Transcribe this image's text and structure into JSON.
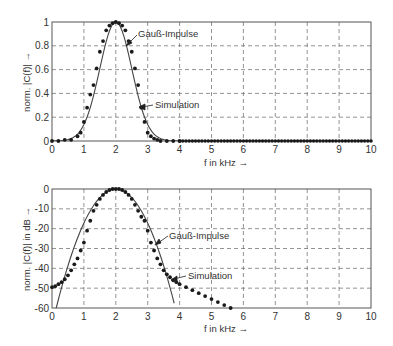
{
  "chart_data": [
    {
      "type": "line",
      "title": "",
      "xlabel": "f  in kHz →",
      "ylabel": "norm. |C(f)| →",
      "xlim": [
        0,
        10
      ],
      "ylim": [
        0,
        1
      ],
      "xticks": [
        "0",
        "1",
        "2",
        "3",
        "4",
        "5",
        "6",
        "7",
        "8",
        "9",
        "10"
      ],
      "yticks": [
        "0",
        "0.2",
        "0.4",
        "0.6",
        "0.8",
        "1"
      ],
      "grid": true,
      "annotations": [
        "Gauß-Impulse",
        "Simulation"
      ],
      "series": [
        {
          "name": "Gauß-Impulse",
          "style": "solid line",
          "x": [
            0,
            0.5,
            0.8,
            1.0,
            1.2,
            1.4,
            1.6,
            1.8,
            2.0,
            2.2,
            2.4,
            2.6,
            2.8,
            3.0,
            3.2,
            3.5,
            4.0,
            10
          ],
          "y": [
            0.0,
            0.01,
            0.06,
            0.14,
            0.28,
            0.49,
            0.73,
            0.92,
            1.0,
            0.92,
            0.73,
            0.49,
            0.28,
            0.14,
            0.06,
            0.01,
            0.0,
            0.0
          ]
        },
        {
          "name": "Simulation",
          "style": "dots",
          "x": [
            0,
            0.2,
            0.4,
            0.6,
            0.8,
            0.9,
            1.0,
            1.1,
            1.2,
            1.3,
            1.4,
            1.5,
            1.6,
            1.7,
            1.8,
            1.9,
            2.0,
            2.1,
            2.2,
            2.3,
            2.4,
            2.5,
            2.6,
            2.7,
            2.8,
            2.9,
            3.0,
            3.1,
            3.2,
            3.3,
            3.4,
            3.6,
            3.8,
            4.0,
            10
          ],
          "y": [
            0.0,
            0.0,
            0.01,
            0.01,
            0.04,
            0.07,
            0.16,
            0.28,
            0.39,
            0.47,
            0.61,
            0.75,
            0.84,
            0.93,
            0.97,
            0.99,
            1.0,
            0.99,
            0.97,
            0.93,
            0.84,
            0.75,
            0.61,
            0.47,
            0.28,
            0.16,
            0.07,
            0.04,
            0.02,
            0.01,
            0.0,
            0.0,
            0.0,
            0.0,
            0.0
          ]
        }
      ]
    },
    {
      "type": "line",
      "title": "",
      "xlabel": "f  in kHz →",
      "ylabel": "norm. |C(f)|  in dB →",
      "xlim": [
        0,
        10
      ],
      "ylim": [
        -60,
        0
      ],
      "xticks": [
        "0",
        "1",
        "2",
        "3",
        "4",
        "5",
        "6",
        "7",
        "8",
        "9",
        "10"
      ],
      "yticks": [
        "0",
        "-10",
        "-20",
        "-30",
        "-40",
        "-50",
        "-60"
      ],
      "grid": true,
      "annotations": [
        "Gauß-Impulse",
        "Simulation"
      ],
      "series": [
        {
          "name": "Gauß-Impulse",
          "style": "solid line",
          "x": [
            0.13,
            0.5,
            1.0,
            1.5,
            2.0,
            2.5,
            3.0,
            3.5,
            3.87
          ],
          "y": [
            -60,
            -38.7,
            -17.2,
            -4.3,
            0,
            -4.3,
            -17.2,
            -38.7,
            -60
          ]
        },
        {
          "name": "Simulation",
          "style": "dots",
          "x": [
            0,
            0.1,
            0.2,
            0.3,
            0.4,
            0.5,
            0.6,
            0.7,
            0.8,
            0.9,
            1.0,
            1.1,
            1.2,
            1.3,
            1.4,
            1.5,
            1.6,
            1.7,
            1.8,
            1.9,
            2.0,
            2.1,
            2.2,
            2.3,
            2.4,
            2.5,
            2.6,
            2.7,
            2.8,
            2.9,
            3.0,
            3.1,
            3.2,
            3.3,
            3.4,
            3.5,
            3.6,
            3.7,
            3.8,
            3.9,
            4.0,
            4.2,
            4.4,
            4.6,
            4.8,
            5.0,
            5.2,
            5.4,
            5.6
          ],
          "y": [
            -49.5,
            -49,
            -48,
            -47,
            -45.5,
            -43.5,
            -41,
            -38,
            -35,
            -31,
            -27,
            -21,
            -16,
            -11,
            -8,
            -5,
            -3,
            -1.5,
            -0.5,
            0,
            0,
            0,
            -0.5,
            -1.5,
            -3,
            -5,
            -8,
            -11,
            -14,
            -16,
            -21,
            -27,
            -31,
            -35,
            -38,
            -41,
            -43,
            -44.5,
            -46,
            -47,
            -48,
            -49.5,
            -51,
            -52.5,
            -54,
            -55.5,
            -57,
            -58.5,
            -60
          ]
        }
      ]
    }
  ],
  "plots": {
    "top": {
      "ylabel": "norm. |C(f)| →",
      "xlabel": "f  in kHz →",
      "ann1": "Gauß-Impulse",
      "ann2": "Simulation"
    },
    "bottom": {
      "ylabel": "norm. |C(f)|  in dB →",
      "xlabel": "f  in kHz →",
      "ann1": "Gauß-Impulse",
      "ann2": "Simulation"
    }
  }
}
